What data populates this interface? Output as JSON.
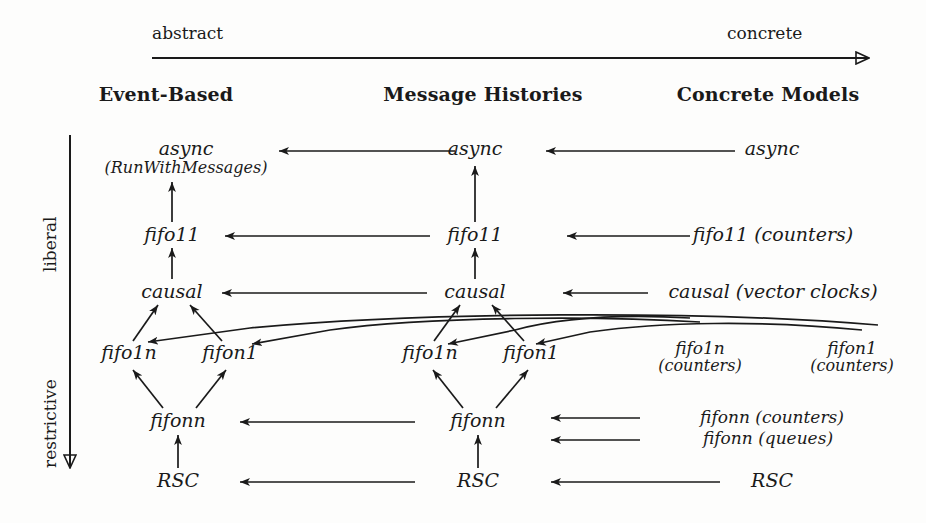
{
  "axes": {
    "horizontal": {
      "left_label": "abstract",
      "right_label": "concrete",
      "direction": "left-to-right"
    },
    "vertical": {
      "top_label": "liberal",
      "bottom_label": "restrictive",
      "direction": "top-to-bottom"
    }
  },
  "columns": [
    {
      "id": "event-based",
      "header": "Event-Based"
    },
    {
      "id": "message-histories",
      "header": "Message Histories"
    },
    {
      "id": "concrete-models",
      "header": "Concrete Models"
    }
  ],
  "nodes": {
    "c1": {
      "async": "async",
      "async_sub": "(RunWithMessages)",
      "fifo11": "fifo11",
      "causal": "causal",
      "fifo1n": "fifo1n",
      "fifon1": "fifon1",
      "fifonn": "fifonn",
      "rsc": "RSC"
    },
    "c2": {
      "async": "async",
      "fifo11": "fifo11",
      "causal": "causal",
      "fifo1n": "fifo1n",
      "fifon1": "fifon1",
      "fifonn": "fifonn",
      "rsc": "RSC"
    },
    "c3": {
      "async": "async",
      "fifo11": "fifo11 (counters)",
      "causal": "causal (vector clocks)",
      "fifo1n": "fifo1n",
      "fifo1n_sub": "(counters)",
      "fifon1": "fifon1",
      "fifon1_sub": "(counters)",
      "fifonn_counters": "fifonn (counters)",
      "fifonn_queues": "fifonn (queues)",
      "rsc": "RSC"
    }
  },
  "style": {
    "ink": "#1a1a1a",
    "paper": "#fdfdfc"
  }
}
